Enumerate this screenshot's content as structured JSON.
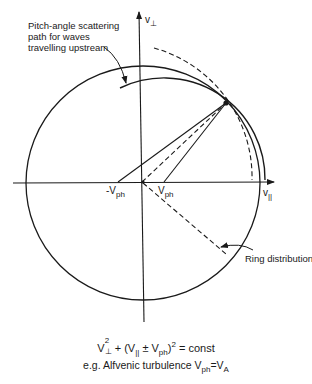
{
  "diagram": {
    "axes": {
      "vertical_label": "v",
      "vertical_sub": "⊥",
      "horizontal_label": "v",
      "horizontal_sub": "||"
    },
    "points": {
      "neg_vph_label": "-V",
      "neg_vph_sub": "ph",
      "pos_vph_label": "V",
      "pos_vph_sub": "ph"
    },
    "annotations": {
      "scattering_path": [
        "Pitch-angle scattering",
        "path for waves",
        "travelling upstream"
      ],
      "ring_distribution": "Ring distribution"
    },
    "formula": {
      "v": "V",
      "sq": "2",
      "perp": "⊥",
      "mid": " + (V",
      "par": "||",
      "pm": " ± V",
      "ph": "ph",
      "close": ")",
      "sq2": "2",
      "rest": " =  const"
    },
    "example": {
      "prefix": "e.g. Alfvenic turbulence V",
      "ph": "ph",
      "eq": "=V",
      "a": "A"
    },
    "colors": {
      "line": "#1a1a1a",
      "background": "#ffffff"
    }
  }
}
